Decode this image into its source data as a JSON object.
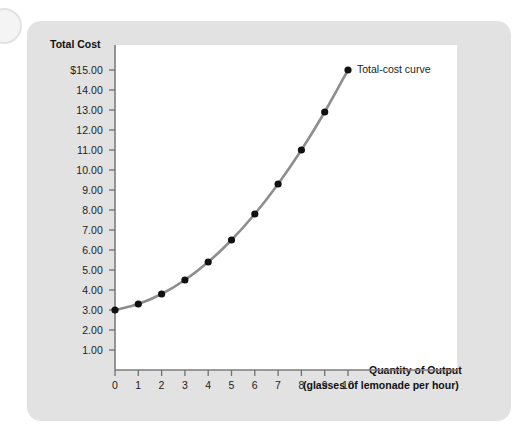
{
  "figure": {
    "background_color": "#e2e2e2",
    "plot_background_color": "#ffffff",
    "curve_color": "#8e8e8e",
    "marker_color": "#111111",
    "axis_color": "#7d7d7d"
  },
  "annotations": {
    "series_label": "Total-cost curve"
  },
  "axis_titles": {
    "y": "Total Cost",
    "x_line1": "Quantity of Output",
    "x_line2": "(glasses of lemonade per hour)"
  },
  "chart_data": {
    "type": "line",
    "title": "",
    "subtitle": "",
    "xlabel": "Quantity of Output (glasses of lemonade per hour)",
    "ylabel": "Total Cost",
    "xlim": [
      0,
      10
    ],
    "ylim": [
      0,
      15
    ],
    "grid": false,
    "legend_position": "inline-annotation-right",
    "xticks": [
      0,
      1,
      2,
      3,
      4,
      5,
      6,
      7,
      8,
      9,
      10
    ],
    "xtick_labels": [
      "0",
      "1",
      "2",
      "3",
      "4",
      "5",
      "6",
      "7",
      "8",
      "9",
      "10"
    ],
    "yticks": [
      1,
      2,
      3,
      4,
      5,
      6,
      7,
      8,
      9,
      10,
      11,
      12,
      13,
      14,
      15
    ],
    "ytick_labels": [
      "1.00",
      "2.00",
      "3.00",
      "4.00",
      "5.00",
      "6.00",
      "7.00",
      "8.00",
      "9.00",
      "10.00",
      "11.00",
      "12.00",
      "13.00",
      "14.00",
      "$15.00"
    ],
    "series": [
      {
        "name": "Total-cost curve",
        "x": [
          0,
          1,
          2,
          3,
          4,
          5,
          6,
          7,
          8,
          9,
          10
        ],
        "values": [
          3.0,
          3.3,
          3.8,
          4.5,
          5.4,
          6.5,
          7.8,
          9.3,
          11.0,
          12.9,
          15.0
        ],
        "marker": "circle",
        "color": "#8e8e8e"
      }
    ]
  }
}
